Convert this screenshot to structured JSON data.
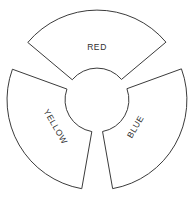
{
  "figure": {
    "background_color": "#ffffff",
    "stroke_color": "#3b3b3b",
    "label_color": "#2e2e2e",
    "center": {
      "x": 97,
      "y": 100
    },
    "outer_radius": 90,
    "inner_radius": 32,
    "sector_span_degrees": 100,
    "gap_degrees": 20
  },
  "chart_data": {
    "type": "pie",
    "title": "",
    "categories": [
      "RED",
      "YELLOW",
      "BLUE"
    ],
    "values": [
      100,
      100,
      100
    ],
    "legend": "none",
    "grid": false,
    "annotations": [
      "RED",
      "YELLOW",
      "BLUE"
    ]
  },
  "sectors": [
    {
      "label": "RED",
      "position": "top",
      "start_angle_deg": -140,
      "end_angle_deg": -40,
      "mid_angle_deg": -90,
      "label_rotation_deg": 0,
      "label_x": 97,
      "label_y": 48
    },
    {
      "label": "YELLOW",
      "position": "lower-left",
      "start_angle_deg": 100,
      "end_angle_deg": 200,
      "mid_angle_deg": 150,
      "label_rotation_deg": 60,
      "label_x": 55,
      "label_y": 127
    },
    {
      "label": "BLUE",
      "position": "lower-right",
      "start_angle_deg": -20,
      "end_angle_deg": 80,
      "mid_angle_deg": 30,
      "label_rotation_deg": -60,
      "label_x": 136,
      "label_y": 127
    }
  ]
}
